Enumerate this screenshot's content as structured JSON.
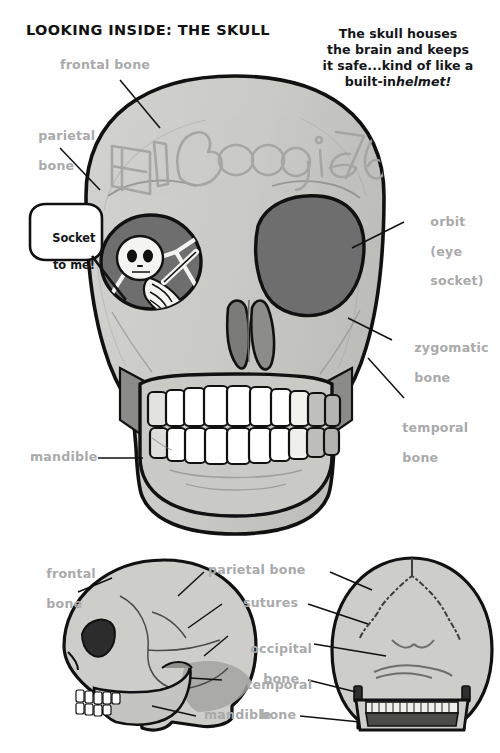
{
  "page": {
    "title": "LOOKING INSIDE: THE SKULL",
    "caption_line1": "The skull houses",
    "caption_line2": "the brain and keeps",
    "caption_line3": "it safe...kind of like a",
    "caption_line4": "built-in",
    "caption_emphasis": "helmet!",
    "background_color": "#ffffff"
  },
  "colors": {
    "bone_fill": "#c9c9c7",
    "bone_fill_light": "#d6d6d3",
    "bone_shadow": "#9a9a98",
    "orbit_dark": "#6a6a6a",
    "outline": "#111111",
    "label_gray": "#a9aaab",
    "tooth_white": "#ffffff",
    "tooth_shadow": "#b9b9b6",
    "graffiti": "#a3a4a2"
  },
  "graffiti": {
    "text": "El Boogie 769",
    "description": "bubble-letter graffiti scrawled across the frontal bone"
  },
  "speech_bubble": {
    "line1": "Socket",
    "line2": "to me!",
    "full_text": "Socket to me!"
  },
  "front_view": {
    "name": "anterior-skull",
    "labels": [
      {
        "id": "frontal-bone",
        "text_line1": "frontal bone",
        "text_line2": "",
        "side": "left"
      },
      {
        "id": "parietal-bone",
        "text_line1": "parietal",
        "text_line2": "bone",
        "side": "left"
      },
      {
        "id": "mandible",
        "text_line1": "mandible",
        "text_line2": "",
        "side": "left"
      },
      {
        "id": "orbit",
        "text_line1": "orbit",
        "text_line2": "(eye",
        "text_line3": "socket)",
        "side": "right"
      },
      {
        "id": "zygomatic-bone",
        "text_line1": "zygomatic",
        "text_line2": "bone",
        "side": "right"
      },
      {
        "id": "temporal-bone",
        "text_line1": "temporal",
        "text_line2": "bone",
        "side": "right"
      }
    ]
  },
  "lower_views": {
    "left_view_name": "lateral-skull",
    "right_view_name": "posterior-skull",
    "labels": [
      {
        "id": "frontal-bone-2",
        "text_line1": "frontal",
        "text_line2": "bone",
        "side": "left"
      },
      {
        "id": "parietal-bone-2",
        "text_line1": "parietal bone",
        "text_line2": "",
        "side": "center"
      },
      {
        "id": "sutures",
        "text_line1": "sutures",
        "text_line2": "",
        "side": "center"
      },
      {
        "id": "occipital-bone",
        "text_line1": "occipital",
        "text_line2": "bone",
        "side": "center"
      },
      {
        "id": "temporal-bone-2",
        "text_line1": "temporal",
        "text_line2": "bone",
        "side": "center"
      },
      {
        "id": "mandible-2",
        "text_line1": "mandible",
        "text_line2": "",
        "side": "center"
      }
    ]
  }
}
